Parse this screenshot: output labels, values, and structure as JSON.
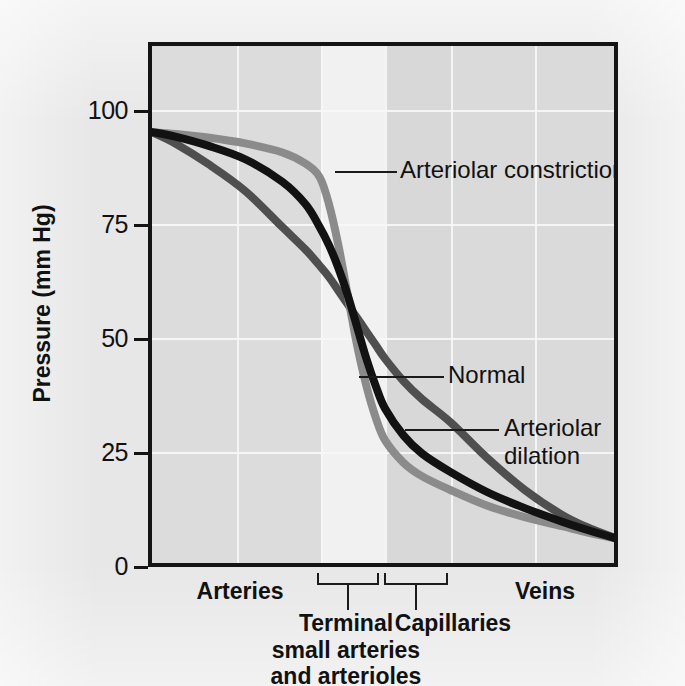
{
  "chart_data": {
    "type": "line",
    "title": "",
    "xlabel": "",
    "ylabel": "Pressure (mm Hg)",
    "ylim": [
      0,
      115
    ],
    "yticks": [
      0,
      25,
      50,
      75,
      100
    ],
    "ytick_labels": [
      "0",
      "25",
      "50",
      "75",
      "100"
    ],
    "grid": "white gridlines, horizontal at each y tick and vertical band separators",
    "legend_position": "inline annotations with leader lines",
    "x_axis_description": "Segments of the systemic vascular tree from arteries to veins",
    "x_segments": [
      {
        "name": "Arteries",
        "x_start": 0,
        "x_end": 36,
        "shade": "#dcdcdc"
      },
      {
        "name": "Terminal small arteries and arterioles",
        "x_start": 36,
        "x_end": 50,
        "shade": "#f1f1f1"
      },
      {
        "name": "Capillaries",
        "x_start": 50,
        "x_end": 64,
        "shade": "#d8d8d8"
      },
      {
        "name": "Veins",
        "x_start": 64,
        "x_end": 100,
        "shade": "#dadada"
      }
    ],
    "series": [
      {
        "name": "Arteriolar constriction",
        "color": "#8b8b8b",
        "x": [
          0,
          5,
          12,
          20,
          28,
          33,
          36,
          38,
          40,
          42,
          44,
          46,
          48,
          50,
          54,
          58,
          64,
          72,
          80,
          88,
          94,
          100
        ],
        "values": [
          96,
          95.6,
          94.8,
          93.5,
          91.5,
          89,
          86,
          80,
          71,
          60,
          49,
          40,
          33,
          28,
          23,
          20,
          17,
          13.5,
          11,
          9,
          7.5,
          6.2
        ]
      },
      {
        "name": "Normal",
        "color": "#121212",
        "x": [
          0,
          5,
          12,
          20,
          28,
          33,
          36,
          38,
          40,
          42,
          44,
          46,
          48,
          50,
          54,
          58,
          64,
          72,
          80,
          88,
          94,
          100
        ],
        "values": [
          96,
          95,
          93,
          90,
          85,
          80,
          75,
          71,
          66,
          60,
          53,
          46,
          40,
          35,
          29,
          25,
          21,
          16.5,
          13,
          10,
          8,
          6.2
        ]
      },
      {
        "name": "Arteriolar dilation",
        "color": "#4f4f4f",
        "x": [
          0,
          5,
          12,
          20,
          28,
          33,
          36,
          38,
          40,
          42,
          44,
          46,
          48,
          50,
          54,
          58,
          64,
          72,
          80,
          88,
          94,
          100
        ],
        "values": [
          96,
          93.5,
          89,
          83,
          75,
          70,
          66.5,
          64,
          61,
          58,
          55,
          52,
          49,
          46,
          41,
          37,
          32,
          24,
          17,
          11.5,
          8.5,
          6.2
        ]
      }
    ],
    "annotations": [
      {
        "text": "Arteriolar constriction",
        "target_series": "Arteriolar constriction"
      },
      {
        "text": "Normal",
        "target_series": "Normal"
      },
      {
        "text": "Arteriolar dilation",
        "target_series": "Arteriolar dilation"
      }
    ]
  },
  "axis": {
    "y_title": "Pressure (mm Hg)",
    "y_ticks": [
      "100",
      "75",
      "50",
      "25",
      "0"
    ]
  },
  "annotations": {
    "constriction": "Arteriolar constriction",
    "normal": "Normal",
    "dilation_line1": "Arteriolar",
    "dilation_line2": "dilation"
  },
  "x_labels": {
    "arteries": "Arteries",
    "veins": "Veins",
    "terminal_line1": "Terminal",
    "terminal_line2": "small arteries",
    "terminal_line3": "and arterioles",
    "capillaries": "Capillaries"
  },
  "colors": {
    "constriction": "#8b8b8b",
    "normal": "#121212",
    "dilation": "#4f4f4f",
    "frame": "#141414",
    "gridline": "#f7f7f7",
    "band_arteries": "#dcdcdc",
    "band_terminal": "#f1f1f1",
    "band_capillaries": "#d8d8d8",
    "band_veins": "#dadada",
    "page": "#e7e7e7"
  }
}
